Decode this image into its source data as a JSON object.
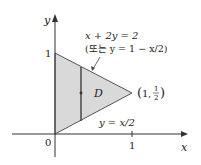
{
  "diagram": {
    "colors": {
      "region_fill": "#d9d9d9",
      "axis": "#333333",
      "edge": "#555555",
      "text": "#222222"
    },
    "axes": {
      "x_label": "x",
      "y_label": "y",
      "origin_label": "0",
      "x_tick_label": "1",
      "y_tick_label": "1"
    },
    "region": {
      "label": "D",
      "vertices": [
        [
          0,
          0
        ],
        [
          0,
          1
        ],
        [
          1,
          0.5
        ]
      ]
    },
    "annotations": {
      "upper_curve_eq": "x + 2y = 2",
      "upper_curve_alt": "(또는 y = 1 − x/2)",
      "lower_curve_eq": "y = x/2",
      "vertex_point": "(1, ½)",
      "vertex_point_x": "1",
      "vertex_point_y_num": "1",
      "vertex_point_y_den": "2"
    }
  }
}
